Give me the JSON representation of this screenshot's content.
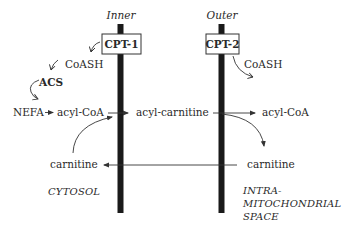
{
  "diagram": {
    "membranes": {
      "inner": {
        "label": "Inner",
        "enzyme": "CPT-1"
      },
      "outer": {
        "label": "Outer",
        "enzyme": "CPT-2"
      }
    },
    "cytosol_side": {
      "coash": "CoASH",
      "acs": "ACS",
      "nefa": "NEFA",
      "acyl_coa": "acyl-CoA",
      "carnitine": "carnitine",
      "region_label": "CYTOSOL"
    },
    "between_membranes": {
      "acyl_carnitine": "acyl-carnitine"
    },
    "matrix_side": {
      "coash": "CoASH",
      "acyl_coa": "acyl-CoA",
      "carnitine": "carnitine",
      "region_label_lines": [
        "INTRA-",
        "MITOCHONDRIAL",
        "SPACE"
      ]
    },
    "colors": {
      "membrane": "#1a1a1a",
      "text": "#2a2a2a",
      "background": "#ffffff"
    }
  }
}
